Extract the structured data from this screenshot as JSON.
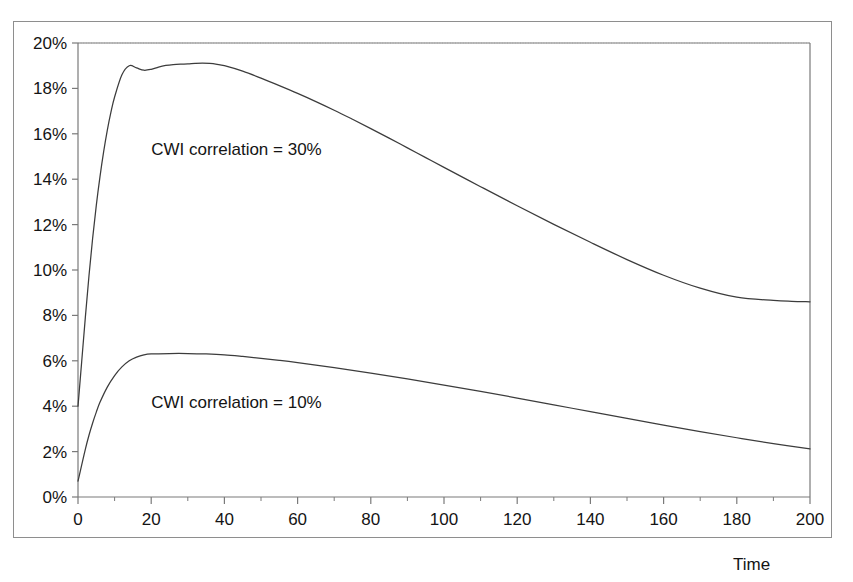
{
  "figure": {
    "background_color": "#ffffff",
    "frame_color": "#8e8e8e",
    "axis_color": "#7a7a7a",
    "curve_color": "#3c3c3c",
    "gridline_color": "#c8c8c8"
  },
  "chart_data": {
    "type": "line",
    "title": "",
    "subtitle": "",
    "xlabel": "Time",
    "ylabel": "",
    "xlim": [
      0,
      200
    ],
    "ylim": [
      0,
      0.2
    ],
    "x_tick_labels": [
      "0",
      "20",
      "40",
      "60",
      "80",
      "100",
      "120",
      "140",
      "160",
      "180",
      "200"
    ],
    "x_tick_values": [
      0,
      20,
      40,
      60,
      80,
      100,
      120,
      140,
      160,
      180,
      200
    ],
    "x_minor_tick_step": 10,
    "y_tick_labels": [
      "0%",
      "2%",
      "4%",
      "6%",
      "8%",
      "10%",
      "12%",
      "14%",
      "16%",
      "18%",
      "20%"
    ],
    "y_tick_values": [
      0,
      0.02,
      0.04,
      0.06,
      0.08,
      0.1,
      0.12,
      0.14,
      0.16,
      0.18,
      0.2
    ],
    "grid": "top-only-dotted",
    "legend": "inline-annotations",
    "annotations": [
      {
        "name": "cwi-correlation-30",
        "text": "CWI correlation = 30%",
        "x": 20,
        "y": 0.157
      },
      {
        "name": "cwi-correlation-10",
        "text": "CWI correlation = 10%",
        "x": 20,
        "y": 0.0455
      }
    ],
    "series": [
      {
        "name": "CWI correlation = 30%",
        "color": "#3c3c3c",
        "x": [
          0,
          1,
          2,
          3,
          4,
          5,
          6,
          7,
          8,
          9,
          10,
          12,
          14,
          16,
          18,
          20,
          22,
          24,
          26,
          28,
          30,
          32,
          34,
          36,
          38,
          40,
          45,
          50,
          55,
          60,
          65,
          70,
          75,
          80,
          85,
          90,
          95,
          100,
          110,
          120,
          130,
          140,
          150,
          160,
          170,
          180,
          190,
          195,
          200
        ],
        "values": [
          0.04,
          0.0595,
          0.079,
          0.0975,
          0.114,
          0.1285,
          0.141,
          0.152,
          0.1615,
          0.1695,
          0.1762,
          0.186,
          0.19,
          0.189,
          0.188,
          0.1884,
          0.1894,
          0.1901,
          0.1905,
          0.1907,
          0.1908,
          0.191,
          0.1911,
          0.191,
          0.1906,
          0.19,
          0.1876,
          0.1845,
          0.1812,
          0.1778,
          0.1742,
          0.1704,
          0.1664,
          0.1623,
          0.1581,
          0.1538,
          0.1495,
          0.1452,
          0.1367,
          0.1283,
          0.1201,
          0.1122,
          0.1046,
          0.0977,
          0.092,
          0.088,
          0.0866,
          0.0862,
          0.086
        ]
      },
      {
        "name": "CWI correlation = 10%",
        "color": "#3c3c3c",
        "x": [
          0,
          1,
          2,
          3,
          4,
          5,
          6,
          8,
          10,
          12,
          14,
          16,
          18,
          20,
          25,
          30,
          35,
          40,
          45,
          50,
          55,
          60,
          70,
          80,
          90,
          100,
          110,
          120,
          130,
          140,
          150,
          160,
          170,
          180,
          190,
          200
        ],
        "values": [
          0.007,
          0.014,
          0.021,
          0.0272,
          0.0326,
          0.0374,
          0.0417,
          0.0484,
          0.0535,
          0.0573,
          0.06,
          0.0616,
          0.0626,
          0.063,
          0.0632,
          0.0632,
          0.063,
          0.0626,
          0.0619,
          0.0611,
          0.0602,
          0.0592,
          0.057,
          0.0546,
          0.052,
          0.0493,
          0.0465,
          0.0436,
          0.0406,
          0.0376,
          0.0346,
          0.0317,
          0.0288,
          0.0261,
          0.0235,
          0.0212
        ]
      }
    ]
  },
  "plot_geometry": {
    "left": 78,
    "top": 43,
    "right": 810,
    "bottom": 497
  }
}
